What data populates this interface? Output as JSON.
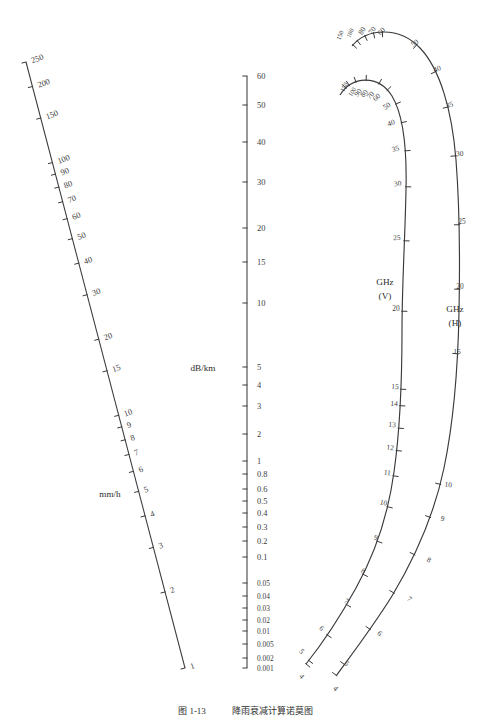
{
  "figure": {
    "caption_number": "图 1-13",
    "caption_text": "降雨衰减计算诺莫图",
    "background": "#ffffff",
    "ink_color": "#3a3a3a"
  },
  "chart_data": {
    "type": "nomogram",
    "title": "降雨衰减计算诺莫图",
    "grid": false,
    "legend": "none",
    "scales": [
      {
        "name": "rain-rate",
        "label": "mm/h",
        "label_x": 110,
        "label_y": 497,
        "axis_type": "log",
        "orientation": "slanted-line",
        "start": {
          "x": 26,
          "y": 62
        },
        "end": {
          "x": 185,
          "y": 668
        },
        "domain": [
          1,
          250
        ],
        "ticks": [
          {
            "value": 250,
            "label": "250",
            "t": 0.0
          },
          {
            "value": 200,
            "label": "200",
            "t": 0.113
          },
          {
            "value": 150,
            "label": "150",
            "t": 0.254
          },
          {
            "value": 100,
            "label": "100",
            "t": 0.443
          },
          {
            "value": 90,
            "label": "90",
            "t": 0.487
          },
          {
            "value": 80,
            "label": "80",
            "t": 0.535
          },
          {
            "value": 70,
            "label": "70",
            "t": 0.585
          },
          {
            "value": 60,
            "label": "60",
            "t": 0.641
          },
          {
            "value": 50,
            "label": "50",
            "t": 0.704
          },
          {
            "value": 40,
            "label": "40",
            "t": 0.775
          },
          {
            "value": 30,
            "label": "30",
            "t": 0.76
          },
          {
            "value": 20,
            "label": "20",
            "t": 0.82
          },
          {
            "value": 15,
            "label": "15",
            "t": 0.862
          },
          {
            "value": 10,
            "label": "10",
            "t": 0.903
          },
          {
            "value": 9,
            "label": "9",
            "t": 0.921
          },
          {
            "value": 8,
            "label": "8",
            "t": 0.935
          },
          {
            "value": 7,
            "label": "7",
            "t": 0.949
          },
          {
            "value": 6,
            "label": "6",
            "t": 0.961
          },
          {
            "value": 5,
            "label": "5",
            "t": 0.971
          },
          {
            "value": 4,
            "label": "4",
            "t": 0.979
          },
          {
            "value": 3,
            "label": "3",
            "t": 0.987
          },
          {
            "value": 2,
            "label": "2",
            "t": 0.994
          },
          {
            "value": 1,
            "label": "1",
            "t": 1.0
          }
        ]
      },
      {
        "name": "attenuation",
        "label": "dB/km",
        "label_x": 203,
        "label_y": 371,
        "axis_type": "log",
        "orientation": "vertical-line",
        "start": {
          "x": 247,
          "y": 76
        },
        "end": {
          "x": 247,
          "y": 668
        },
        "domain": [
          0.001,
          60
        ],
        "ticks": [
          {
            "value": 60,
            "label": "60",
            "y": 76
          },
          {
            "value": 50,
            "label": "50",
            "y": 105
          },
          {
            "value": 40,
            "label": "40",
            "y": 142
          },
          {
            "value": 30,
            "label": "30",
            "y": 182
          },
          {
            "value": 20,
            "label": "20",
            "y": 228
          },
          {
            "value": 15,
            "label": "15",
            "y": 262
          },
          {
            "value": 10,
            "label": "10",
            "y": 303
          },
          {
            "value": 5,
            "label": "5",
            "y": 367
          },
          {
            "value": 4,
            "label": "4",
            "y": 385
          },
          {
            "value": 3,
            "label": "3",
            "y": 406
          },
          {
            "value": 2,
            "label": "2",
            "y": 434
          },
          {
            "value": 1,
            "label": "1",
            "y": 461
          },
          {
            "value": 0.8,
            "label": "0.8",
            "y": 474
          },
          {
            "value": 0.6,
            "label": "0.6",
            "y": 489
          },
          {
            "value": 0.5,
            "label": "0.5",
            "y": 501
          },
          {
            "value": 0.4,
            "label": "0.4",
            "y": 513
          },
          {
            "value": 0.3,
            "label": "0.3",
            "y": 527
          },
          {
            "value": 0.2,
            "label": "0.2",
            "y": 541
          },
          {
            "value": 0.1,
            "label": "0.1",
            "y": 557
          },
          {
            "value": 0.05,
            "label": "0.05",
            "y": 583
          },
          {
            "value": 0.04,
            "label": "0.04",
            "y": 596
          },
          {
            "value": 0.03,
            "label": "0.03",
            "y": 608
          },
          {
            "value": 0.02,
            "label": "0.02",
            "y": 620
          },
          {
            "value": 0.01,
            "label": "0.01",
            "y": 631
          },
          {
            "value": 0.005,
            "label": "0.005",
            "y": 644
          },
          {
            "value": 0.002,
            "label": "0.002",
            "y": 658
          },
          {
            "value": 0.001,
            "label": "0.001",
            "y": 668
          }
        ]
      },
      {
        "name": "frequency-vertical",
        "label": "GHz\n(V)",
        "label_line1": "GHz",
        "label_line2": "(V)",
        "label_x": 385,
        "label_y": 285,
        "axis_type": "curved-arc",
        "polarization": "V",
        "domain": [
          4,
          150
        ],
        "ticks": [
          {
            "value": 150,
            "label": "150",
            "x": 346,
            "y": 88,
            "rot": -62
          },
          {
            "value": 100,
            "label": "100",
            "x": 354,
            "y": 93,
            "rot": -58
          },
          {
            "value": 90,
            "label": "90",
            "x": 360,
            "y": 94,
            "rot": -54
          },
          {
            "value": 80,
            "label": "80",
            "x": 366,
            "y": 95,
            "rot": -50
          },
          {
            "value": 70,
            "label": "70",
            "x": 372,
            "y": 97,
            "rot": -45
          },
          {
            "value": 60,
            "label": "60",
            "x": 378,
            "y": 99,
            "rot": -40
          },
          {
            "value": 50,
            "label": "50",
            "x": 388,
            "y": 108,
            "rot": -33
          },
          {
            "value": 40,
            "label": "40",
            "x": 392,
            "y": 125,
            "rot": -22
          },
          {
            "value": 35,
            "label": "35",
            "x": 396,
            "y": 151,
            "rot": -14
          },
          {
            "value": 30,
            "label": "30",
            "x": 398,
            "y": 186,
            "rot": -8
          },
          {
            "value": 25,
            "label": "25",
            "x": 397,
            "y": 240,
            "rot": -3
          },
          {
            "value": 20,
            "label": "20",
            "x": 396,
            "y": 311,
            "rot": 0
          },
          {
            "value": 15,
            "label": "15",
            "x": 395,
            "y": 389,
            "rot": 2
          },
          {
            "value": 14,
            "label": "14",
            "x": 394,
            "y": 406,
            "rot": 3
          },
          {
            "value": 13,
            "label": "13",
            "x": 392,
            "y": 427,
            "rot": 4
          },
          {
            "value": 12,
            "label": "12",
            "x": 390,
            "y": 450,
            "rot": 6
          },
          {
            "value": 11,
            "label": "11",
            "x": 387,
            "y": 475,
            "rot": 8
          },
          {
            "value": 10,
            "label": "10",
            "x": 383,
            "y": 505,
            "rot": 12
          },
          {
            "value": 9,
            "label": "9",
            "x": 375,
            "y": 540,
            "rot": 20
          },
          {
            "value": 8,
            "label": "8",
            "x": 362,
            "y": 573,
            "rot": 30
          },
          {
            "value": 7,
            "label": "7",
            "x": 345,
            "y": 603,
            "rot": 38
          },
          {
            "value": 6,
            "label": "6",
            "x": 320,
            "y": 630,
            "rot": 44
          },
          {
            "value": 5,
            "label": "5",
            "x": 300,
            "y": 653,
            "rot": 46
          },
          {
            "value": 4,
            "label": "4",
            "x": 300,
            "y": 678,
            "rot": 46
          }
        ]
      },
      {
        "name": "frequency-horizontal",
        "label": "GHz\n(H)",
        "label_line1": "GHz",
        "label_line2": "(H)",
        "label_x": 455,
        "label_y": 312,
        "axis_type": "curved-arc",
        "polarization": "H",
        "domain": [
          4,
          150
        ],
        "ticks": [
          {
            "value": 150,
            "label": "150",
            "x": 342,
            "y": 36,
            "rot": -68
          },
          {
            "value": 100,
            "label": "100",
            "x": 352,
            "y": 34,
            "rot": -64
          },
          {
            "value": 80,
            "label": "80",
            "x": 364,
            "y": 32,
            "rot": -58
          },
          {
            "value": 70,
            "label": "70",
            "x": 374,
            "y": 32,
            "rot": -52
          },
          {
            "value": 60,
            "label": "60",
            "x": 383,
            "y": 33,
            "rot": -46
          },
          {
            "value": 50,
            "label": "50",
            "x": 416,
            "y": 45,
            "rot": -34
          },
          {
            "value": 40,
            "label": "40",
            "x": 438,
            "y": 71,
            "rot": -22
          },
          {
            "value": 35,
            "label": "35",
            "x": 450,
            "y": 107,
            "rot": -14
          },
          {
            "value": 30,
            "label": "30",
            "x": 460,
            "y": 156,
            "rot": -5
          },
          {
            "value": 25,
            "label": "25",
            "x": 462,
            "y": 224,
            "rot": 0
          },
          {
            "value": 20,
            "label": "20",
            "x": 460,
            "y": 289,
            "rot": 0
          },
          {
            "value": 15,
            "label": "15",
            "x": 457,
            "y": 354,
            "rot": 2
          },
          {
            "value": 10,
            "label": "10",
            "x": 448,
            "y": 487,
            "rot": 8
          },
          {
            "value": 9,
            "label": "9",
            "x": 442,
            "y": 521,
            "rot": 14
          },
          {
            "value": 8,
            "label": "8",
            "x": 428,
            "y": 562,
            "rot": 26
          },
          {
            "value": 7,
            "label": "7",
            "x": 408,
            "y": 601,
            "rot": 38
          },
          {
            "value": 6,
            "label": "6",
            "x": 378,
            "y": 635,
            "rot": 45
          },
          {
            "value": 5,
            "label": "5",
            "x": 345,
            "y": 665,
            "rot": 47
          },
          {
            "value": 4,
            "label": "4",
            "x": 334,
            "y": 690,
            "rot": 47
          }
        ]
      }
    ]
  }
}
